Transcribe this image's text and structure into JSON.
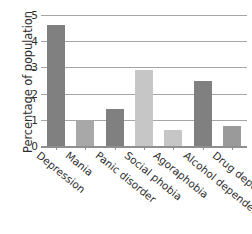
{
  "chart_data": {
    "type": "bar",
    "title": "",
    "xlabel": "",
    "ylabel": "Percentage of population",
    "categories": [
      "Depression",
      "Mania",
      "Panic disorder",
      "Social phobia",
      "Agoraphobia",
      "Alcohol dependence",
      "Drug dependence"
    ],
    "values": [
      4.6,
      1.0,
      1.4,
      2.9,
      0.6,
      2.5,
      0.75
    ],
    "bar_colors": [
      "#808080",
      "#a8a8a8",
      "#808080",
      "#c6c6c6",
      "#c6c6c6",
      "#808080",
      "#9a9a9a"
    ],
    "ylim": [
      0,
      5
    ],
    "yticks": [
      0,
      1,
      2,
      3,
      4,
      5
    ],
    "ytick_labels": [
      "0",
      "1",
      "2",
      "3",
      "4",
      "5"
    ],
    "grid": true,
    "grid_color": "#a6a6a6",
    "legend": false,
    "xtick_label_rotation": 39,
    "axis_color": "#8f8f8f",
    "background": "#ffffff"
  }
}
